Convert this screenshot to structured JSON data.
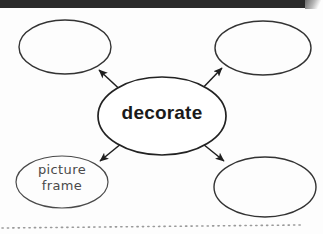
{
  "page": {
    "kind": "worksheet-scan",
    "background_color": "#fdfdfd",
    "top_band_color": "#2b2b2b",
    "ink_color": "#1f1f1f"
  },
  "diagram": {
    "type": "word-web",
    "center": {
      "label": "decorate",
      "shape": "ellipse",
      "cx": 162,
      "cy": 116,
      "rx": 64,
      "ry": 39,
      "filled": false
    },
    "branches": [
      {
        "name": "top-left",
        "label": "",
        "shape": "ellipse",
        "cx": 65,
        "cy": 47,
        "rx": 46,
        "ry": 27,
        "arrow": {
          "from_x": 127,
          "from_y": 96,
          "to_x": 99,
          "to_y": 70
        }
      },
      {
        "name": "top-right",
        "label": "",
        "shape": "ellipse",
        "cx": 263,
        "cy": 48,
        "rx": 48,
        "ry": 27,
        "arrow": {
          "from_x": 197,
          "from_y": 94,
          "to_x": 222,
          "to_y": 68
        }
      },
      {
        "name": "bottom-left",
        "label": "picture frame",
        "label_lines": [
          "picture",
          "frame"
        ],
        "shape": "ellipse",
        "cx": 62,
        "cy": 182,
        "rx": 46,
        "ry": 26,
        "arrow": {
          "from_x": 127,
          "from_y": 139,
          "to_x": 100,
          "to_y": 161
        }
      },
      {
        "name": "bottom-right",
        "label": "",
        "shape": "ellipse",
        "cx": 265,
        "cy": 187,
        "rx": 51,
        "ry": 30,
        "arrow": {
          "from_x": 198,
          "from_y": 140,
          "to_x": 224,
          "to_y": 161
        }
      }
    ],
    "dotted_rule": {
      "name": "dotted-guide-line",
      "x_start": 2,
      "x_end": 301,
      "y_start": 228,
      "y_end": 225,
      "color": "#9a9a9a"
    }
  }
}
